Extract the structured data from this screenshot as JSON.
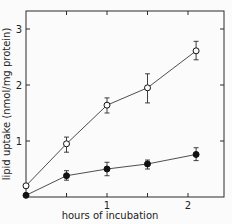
{
  "chart_data": {
    "type": "line",
    "title": "",
    "xlabel": "hours of incubation",
    "ylabel": "lipid uptake (nmol/mg protein)",
    "xlim": [
      0,
      2.5
    ],
    "ylim": [
      0,
      3.3
    ],
    "xticks": [
      0.5,
      1,
      1.5,
      2
    ],
    "xtick_labels": [
      "",
      "1",
      "",
      "2"
    ],
    "yticks": [
      1,
      2,
      3
    ],
    "ytick_labels": [
      "1",
      "2",
      "3"
    ],
    "grid": false,
    "legend": null,
    "series": [
      {
        "name": "open circles",
        "marker": "open-circle",
        "x": [
          0,
          0.5,
          1,
          1.5,
          2.1
        ],
        "y": [
          0.2,
          0.95,
          1.64,
          1.95,
          2.61
        ],
        "err_low": [
          0.2,
          0.8,
          1.5,
          1.68,
          2.45
        ],
        "err_high": [
          0.2,
          1.07,
          1.77,
          2.2,
          2.78
        ]
      },
      {
        "name": "filled circles",
        "marker": "filled-circle",
        "x": [
          0,
          0.5,
          1,
          1.5,
          2.1
        ],
        "y": [
          0.03,
          0.38,
          0.5,
          0.59,
          0.76
        ],
        "err_low": [
          0.03,
          0.3,
          0.38,
          0.5,
          0.65
        ],
        "err_high": [
          0.03,
          0.47,
          0.62,
          0.66,
          0.88
        ]
      }
    ]
  }
}
